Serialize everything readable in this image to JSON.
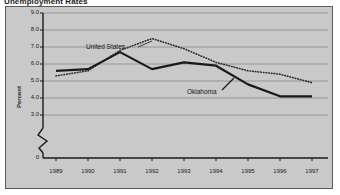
{
  "figure": {
    "title": "Unemployment Rates",
    "background_color": "#c9c9c9",
    "border_color": "#5a5a5a"
  },
  "axes": {
    "y_title": "Percent",
    "y_ticks": [
      "9.0",
      "8.0",
      "7.0",
      "6.0",
      "5.0",
      "4.0",
      "3.0",
      "0"
    ],
    "x_ticks": [
      "1989",
      "1990",
      "1991",
      "1992",
      "1993",
      "1994",
      "1995",
      "1996",
      "1997"
    ],
    "y_break": true
  },
  "annotations": {
    "us_label": "United States",
    "ok_label": "Oklahoma"
  },
  "chart_data": {
    "type": "line",
    "title": "Unemployment Rates",
    "xlabel": "",
    "ylabel": "Percent",
    "x": [
      1989,
      1990,
      1991,
      1992,
      1993,
      1994,
      1995,
      1996,
      1997
    ],
    "categories": [
      "1989",
      "1990",
      "1991",
      "1992",
      "1993",
      "1994",
      "1995",
      "1996",
      "1997"
    ],
    "ylim": [
      3.0,
      9.0
    ],
    "y_axis_break_between": [
      0,
      3.0
    ],
    "yticks": [
      3.0,
      4.0,
      5.0,
      6.0,
      7.0,
      8.0,
      9.0
    ],
    "grid": true,
    "legend": "inline-annotations",
    "series": [
      {
        "name": "United States",
        "style": "dotted",
        "color": "#2b2b2b",
        "values": [
          5.3,
          5.6,
          6.8,
          7.5,
          6.9,
          6.1,
          5.6,
          5.4,
          4.9
        ]
      },
      {
        "name": "Oklahoma",
        "style": "solid",
        "color": "#1a1a1a",
        "values": [
          5.6,
          5.7,
          6.7,
          5.7,
          6.1,
          5.9,
          4.8,
          4.1,
          4.1
        ]
      }
    ]
  }
}
